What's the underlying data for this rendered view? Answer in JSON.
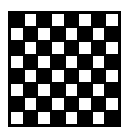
{
  "board": {
    "rows": 8,
    "cols": 8,
    "dark_color": "#000000",
    "light_color": "#ffffff",
    "top_left": "dark"
  }
}
